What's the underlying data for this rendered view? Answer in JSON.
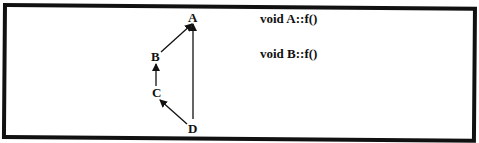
{
  "diagram": {
    "nodes": [
      {
        "id": "A",
        "label": "A"
      },
      {
        "id": "B",
        "label": "B"
      },
      {
        "id": "C",
        "label": "C"
      },
      {
        "id": "D",
        "label": "D"
      }
    ],
    "edges": [
      {
        "from": "B",
        "to": "A"
      },
      {
        "from": "C",
        "to": "B"
      },
      {
        "from": "D",
        "to": "C"
      },
      {
        "from": "D",
        "to": "A"
      }
    ],
    "colors": {
      "stroke": "#111111",
      "background": "#ffffff"
    }
  },
  "code": {
    "lines": [
      "void A::f()",
      "void B::f()"
    ]
  }
}
